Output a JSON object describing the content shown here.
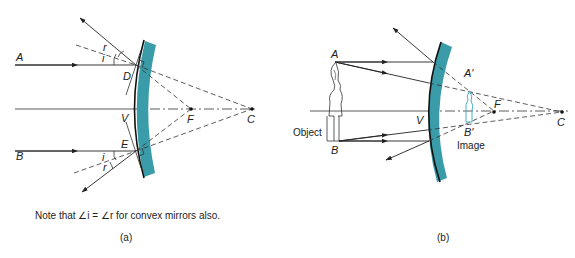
{
  "figure": {
    "panel_a": {
      "caption_label": "(a)",
      "note": "Note that ∠i = ∠r for convex mirrors also.",
      "labels": {
        "ray_a": "A",
        "ray_b": "B",
        "point_d": "D",
        "point_e": "E",
        "vertex": "V",
        "focus": "F",
        "center": "C",
        "angle_i_top": "i",
        "angle_r_top": "r",
        "angle_i_bottom": "i",
        "angle_r_bottom": "r"
      }
    },
    "panel_b": {
      "caption_label": "(b)",
      "labels": {
        "object_top": "A",
        "object_bottom": "B",
        "image_top": "A'",
        "image_bottom": "B'",
        "vertex": "V",
        "focus": "F",
        "center": "C",
        "object": "Object",
        "image": "Image"
      }
    },
    "colors": {
      "mirror": "#3a9ca8",
      "image_figure": "#4bb0c0",
      "lines": "#222222"
    }
  }
}
